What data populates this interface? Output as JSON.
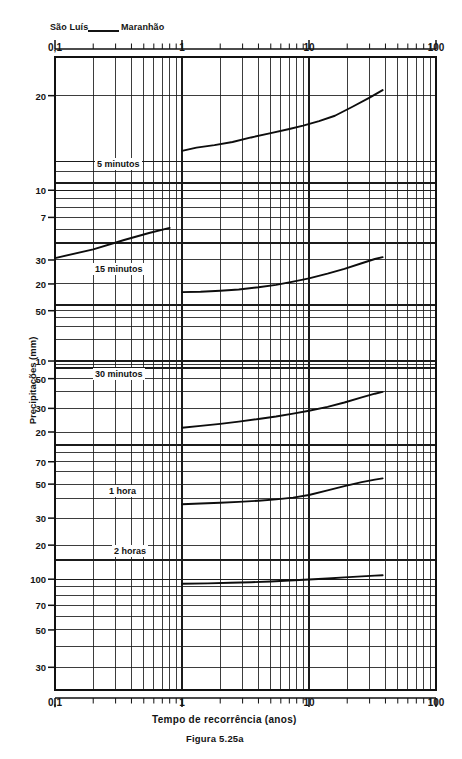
{
  "header": {
    "station": "São Luís",
    "state": "Maranhão",
    "separator_icon": "horizontal-dash-icon"
  },
  "figure": {
    "caption": "Figura 5.25a"
  },
  "chart_data": {
    "type": "line",
    "xlabel": "Tempo de recorrência (anos)",
    "ylabel": "Precipitações (mm)",
    "xscale": "log",
    "yscale": "log",
    "xlim": [
      0.1,
      100
    ],
    "ylim": [
      3,
      300
    ],
    "grid": true,
    "legend": "inline-labels",
    "xtick_labels": [
      "0,1",
      "1",
      "10",
      "100"
    ],
    "xtick_values": [
      0.1,
      1,
      10,
      100
    ],
    "xtick_labels_top": [
      "0,1",
      "1",
      "10",
      "100"
    ],
    "ytick_labels": [
      "20",
      "10",
      "7",
      "30",
      "20",
      "10",
      "50",
      "30",
      "20",
      "70",
      "50",
      "30",
      "20",
      "100",
      "70",
      "50",
      "30"
    ],
    "ytick_values": [
      200,
      100,
      70,
      30,
      20,
      10,
      50,
      30,
      20,
      70,
      50,
      30,
      20,
      100,
      70,
      50,
      30
    ],
    "series": [
      {
        "name": "5 minutos",
        "label": "5 minutos",
        "x": [
          0.1,
          0.2,
          0.35,
          0.55,
          0.8,
          1.0,
          1.3,
          1.8,
          2.5,
          3.5,
          5.0,
          7.0,
          9.0,
          12.0,
          16.0,
          22.0,
          30.0,
          38.0
        ],
        "y": [
          4.1,
          4.6,
          5.2,
          5.7,
          6.1,
          11.2,
          11.6,
          11.9,
          12.3,
          12.9,
          13.5,
          14.1,
          14.6,
          15.3,
          16.2,
          17.8,
          19.6,
          21.2
        ]
      },
      {
        "name": "15 minutos",
        "label": "15 minutos",
        "x": [
          1.0,
          1.4,
          2.0,
          2.8,
          4.0,
          5.5,
          7.5,
          10.0,
          14.0,
          19.0,
          26.0,
          33.0,
          38.0
        ],
        "y": [
          17.4,
          17.5,
          17.8,
          18.2,
          18.9,
          19.7,
          20.8,
          22.0,
          23.8,
          25.8,
          28.4,
          30.5,
          31.5
        ]
      },
      {
        "name": "30 minutos",
        "label": "30 minutos",
        "x": [
          1.0,
          1.4,
          2.0,
          2.8,
          4.0,
          5.5,
          7.5,
          10.0,
          14.0,
          19.0,
          26.0,
          33.0,
          38.0
        ],
        "y": [
          21.5,
          22.2,
          23.0,
          23.9,
          25.0,
          26.1,
          27.4,
          28.8,
          30.8,
          33.2,
          36.2,
          38.6,
          39.8
        ]
      },
      {
        "name": "1 hora",
        "label": "1 hora",
        "x": [
          1.0,
          1.4,
          2.0,
          2.8,
          4.0,
          5.5,
          7.5,
          10.0,
          14.0,
          19.0,
          26.0,
          33.0,
          38.0
        ],
        "y": [
          37.0,
          37.4,
          37.8,
          38.3,
          39.0,
          39.8,
          40.8,
          42.5,
          45.5,
          48.5,
          51.5,
          53.5,
          54.5
        ]
      },
      {
        "name": "2 horas",
        "label": "2 horas",
        "x": [
          1.0,
          1.6,
          2.4,
          3.5,
          5.0,
          7.0,
          10.0,
          14.0,
          19.0,
          26.0,
          33.0,
          38.0
        ],
        "y": [
          94.0,
          94.5,
          95.2,
          96.0,
          97.0,
          98.2,
          99.5,
          101.0,
          102.5,
          104.0,
          105.0,
          105.5
        ]
      }
    ]
  }
}
